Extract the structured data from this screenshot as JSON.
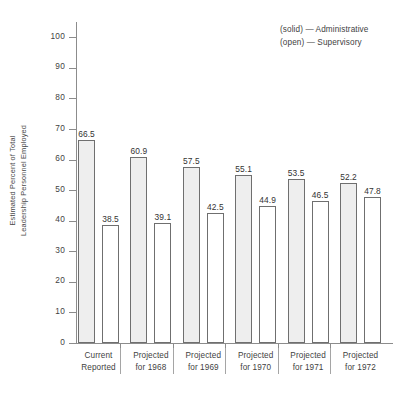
{
  "chart_data": {
    "type": "bar",
    "title": "",
    "xlabel": "",
    "ylabel": "Estimated Percent of Total Leadership Personnel Employed",
    "ylabel_lines": [
      "Estimated Percent of Total",
      "Leadership Personnel Employed"
    ],
    "ylim": [
      0,
      105
    ],
    "yticks": [
      0,
      10,
      20,
      30,
      40,
      50,
      60,
      70,
      80,
      90,
      100
    ],
    "ytick_labels": [
      "0",
      "10",
      "20",
      "30",
      "40",
      "50",
      "60",
      "70",
      "80",
      "90",
      "100"
    ],
    "grid": false,
    "legend_position": "top-right",
    "categories": [
      "Current Reported",
      "Projected for 1968",
      "Projected for 1969",
      "Projected for 1970",
      "Projected for 1971",
      "Projected for 1972"
    ],
    "category_lines": [
      [
        "Current",
        "Reported"
      ],
      [
        "Projected",
        "for 1968"
      ],
      [
        "Projected",
        "for 1969"
      ],
      [
        "Projected",
        "for 1970"
      ],
      [
        "Projected",
        "for 1971"
      ],
      [
        "Projected",
        "for 1972"
      ]
    ],
    "series": [
      {
        "name": "Administrative",
        "style": "solid",
        "values": [
          66.5,
          60.9,
          57.5,
          55.1,
          53.5,
          52.2
        ],
        "value_labels": [
          "66.5",
          "60.9",
          "57.5",
          "55.1",
          "53.5",
          "52.2"
        ]
      },
      {
        "name": "Supervisory",
        "style": "open",
        "values": [
          38.5,
          39.1,
          42.5,
          44.9,
          46.5,
          47.8
        ],
        "value_labels": [
          "38.5",
          "39.1",
          "42.5",
          "44.9",
          "46.5",
          "47.8"
        ]
      }
    ],
    "legend": [
      {
        "marker": "(solid)",
        "dash": "—",
        "label": "Administrative"
      },
      {
        "marker": "(open)",
        "dash": "—",
        "label": "Supervisory"
      }
    ]
  }
}
